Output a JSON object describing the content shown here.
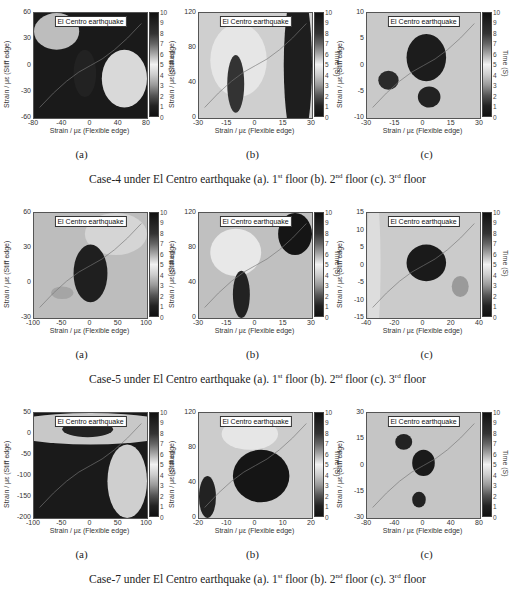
{
  "figure": {
    "legend_text": "El Centro earthquake",
    "xlabel": "Strain / με (Flexible edge)",
    "ylabel": "Strain / με (Stiff edge)",
    "colorbar_label": "Time (S)",
    "colorbar_ticks": [
      "10",
      "9",
      "8",
      "7",
      "6",
      "5",
      "4",
      "3",
      "2",
      "1",
      "0"
    ],
    "rows": [
      {
        "caption": {
          "pre": "Case-4 under El Centro earthquake (a). 1",
          "s1": "st",
          "mid1": " floor (b). 2",
          "s2": "nd",
          "mid2": " floor (c). 3",
          "s3": "rd",
          "post": " floor"
        },
        "panels": [
          {
            "sub": "(a)",
            "yticks": [
              "60",
              "30",
              "0",
              "-30",
              "-60"
            ],
            "xticks": [
              "-80",
              "-40",
              "0",
              "40",
              "80"
            ]
          },
          {
            "sub": "(b)",
            "yticks": [
              "120",
              "80",
              "40",
              "0"
            ],
            "xticks": [
              "-30",
              "-15",
              "0",
              "15",
              "30"
            ]
          },
          {
            "sub": "(c)",
            "yticks": [
              "10",
              "5",
              "0",
              "-5",
              "-10"
            ],
            "xticks": [
              "-30",
              "-15",
              "0",
              "15",
              "30"
            ]
          }
        ]
      },
      {
        "caption": {
          "pre": "Case-5 under El Centro earthquake (a). 1",
          "s1": "st",
          "mid1": " floor (b). 2",
          "s2": "nd",
          "mid2": " floor (c). 3",
          "s3": "rd",
          "post": " floor"
        },
        "panels": [
          {
            "sub": "(a)",
            "yticks": [
              "60",
              "30",
              "0",
              "-30"
            ],
            "xticks": [
              "-100",
              "-50",
              "0",
              "50",
              "100"
            ]
          },
          {
            "sub": "(b)",
            "yticks": [
              "120",
              "80",
              "40",
              "0"
            ],
            "xticks": [
              "-30",
              "-15",
              "0",
              "15",
              "30"
            ]
          },
          {
            "sub": "(c)",
            "yticks": [
              "15",
              "10",
              "5",
              "0",
              "-5",
              "-10",
              "-15"
            ],
            "xticks": [
              "-40",
              "-20",
              "0",
              "20",
              "40"
            ]
          }
        ]
      },
      {
        "caption": {
          "pre": "Case-7 under El Centro earthquake (a). 1",
          "s1": "st",
          "mid1": " floor (b). 2",
          "s2": "nd",
          "mid2": " floor (c). 3",
          "s3": "rd",
          "post": " floor"
        },
        "panels": [
          {
            "sub": "(a)",
            "yticks": [
              "50",
              "0",
              "-50",
              "-100",
              "-150",
              "-200"
            ],
            "xticks": [
              "-100",
              "-50",
              "0",
              "50",
              "100"
            ]
          },
          {
            "sub": "(b)",
            "yticks": [
              "120",
              "80",
              "40",
              "0"
            ],
            "xticks": [
              "-20",
              "-10",
              "0",
              "10",
              "20"
            ]
          },
          {
            "sub": "(c)",
            "yticks": [
              "30",
              "15",
              "0",
              "-15",
              "-30"
            ],
            "xticks": [
              "-80",
              "-40",
              "0",
              "40",
              "80"
            ]
          }
        ]
      }
    ]
  },
  "chart_data": [
    {
      "type": "heatmap",
      "title": "Case-4 1st floor",
      "legend": "El Centro earthquake",
      "xlabel": "Strain / με (Flexible edge)",
      "ylabel": "Strain / με (Stiff edge)",
      "xlim": [
        -80,
        80
      ],
      "ylim": [
        -60,
        60
      ],
      "colorbar": {
        "label": "Time (S)",
        "range": [
          0,
          10
        ]
      }
    },
    {
      "type": "heatmap",
      "title": "Case-4 2nd floor",
      "legend": "El Centro earthquake",
      "xlabel": "Strain / με (Flexible edge)",
      "ylabel": "Strain / με (Stiff edge)",
      "xlim": [
        -30,
        30
      ],
      "ylim": [
        0,
        120
      ],
      "colorbar": {
        "label": "Time (S)",
        "range": [
          0,
          10
        ]
      }
    },
    {
      "type": "heatmap",
      "title": "Case-4 3rd floor",
      "legend": "El Centro earthquake",
      "xlabel": "Strain / με (Flexible edge)",
      "ylabel": "Strain / με (Stiff edge)",
      "xlim": [
        -30,
        30
      ],
      "ylim": [
        -10,
        10
      ],
      "colorbar": {
        "label": "Time (S)",
        "range": [
          0,
          10
        ]
      }
    },
    {
      "type": "heatmap",
      "title": "Case-5 1st floor",
      "legend": "El Centro earthquake",
      "xlabel": "Strain / με (Flexible edge)",
      "ylabel": "Strain / με (Stiff edge)",
      "xlim": [
        -100,
        100
      ],
      "ylim": [
        -30,
        60
      ],
      "colorbar": {
        "label": "Time (S)",
        "range": [
          0,
          10
        ]
      }
    },
    {
      "type": "heatmap",
      "title": "Case-5 2nd floor",
      "legend": "El Centro earthquake",
      "xlabel": "Strain / με (Flexible edge)",
      "ylabel": "Strain / με (Stiff edge)",
      "xlim": [
        -30,
        30
      ],
      "ylim": [
        0,
        120
      ],
      "colorbar": {
        "label": "Time (S)",
        "range": [
          0,
          10
        ]
      }
    },
    {
      "type": "heatmap",
      "title": "Case-5 3rd floor",
      "legend": "El Centro earthquake",
      "xlabel": "Strain / με (Flexible edge)",
      "ylabel": "Strain / με (Stiff edge)",
      "xlim": [
        -40,
        40
      ],
      "ylim": [
        -15,
        15
      ],
      "colorbar": {
        "label": "Time (S)",
        "range": [
          0,
          10
        ]
      }
    },
    {
      "type": "heatmap",
      "title": "Case-7 1st floor",
      "legend": "El Centro earthquake",
      "xlabel": "Strain / με (Flexible edge)",
      "ylabel": "Strain / με (Stiff edge)",
      "xlim": [
        -100,
        100
      ],
      "ylim": [
        -200,
        50
      ],
      "colorbar": {
        "label": "Time (S)",
        "range": [
          0,
          10
        ]
      }
    },
    {
      "type": "heatmap",
      "title": "Case-7 2nd floor",
      "legend": "El Centro earthquake",
      "xlabel": "Strain / με (Flexible edge)",
      "ylabel": "Strain / με (Stiff edge)",
      "xlim": [
        -20,
        20
      ],
      "ylim": [
        0,
        120
      ],
      "colorbar": {
        "label": "Time (S)",
        "range": [
          0,
          10
        ]
      }
    },
    {
      "type": "heatmap",
      "title": "Case-7 3rd floor",
      "legend": "El Centro earthquake",
      "xlabel": "Strain / με (Flexible edge)",
      "ylabel": "Strain / με (Stiff edge)",
      "xlim": [
        -80,
        80
      ],
      "ylim": [
        -30,
        30
      ],
      "colorbar": {
        "label": "Time (S)",
        "range": [
          0,
          10
        ]
      }
    }
  ]
}
